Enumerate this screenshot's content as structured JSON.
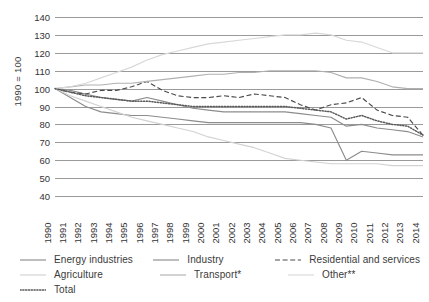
{
  "axis": {
    "y_title": "1990 = 100",
    "y_ticks": [
      "140",
      "130",
      "120",
      "110",
      "100",
      "90",
      "80",
      "70",
      "60",
      "50",
      "40"
    ],
    "x_ticks": [
      "1990",
      "1991",
      "1992",
      "1993",
      "1994",
      "1995",
      "1996",
      "1997",
      "1998",
      "1999",
      "2000",
      "2001",
      "2002",
      "2003",
      "2004",
      "2005",
      "2006",
      "2007",
      "2008",
      "2009",
      "2010",
      "2011",
      "2012",
      "2013",
      "2014"
    ]
  },
  "legend": {
    "rows": [
      [
        {
          "label": "Energy industries",
          "style": "solid",
          "color": "#8c8c8c"
        },
        {
          "label": "Industry",
          "style": "solid",
          "color": "#8c8c8c"
        },
        {
          "label": "Residential and services",
          "style": "dashed",
          "color": "#4a4a4a"
        }
      ],
      [
        {
          "label": "Agriculture",
          "style": "solid",
          "color": "#d2d2d2"
        },
        {
          "label": "Transport*",
          "style": "solid",
          "color": "#b0b0b0"
        },
        {
          "label": "Other**",
          "style": "solid",
          "color": "#d8d8d8"
        }
      ],
      [
        {
          "label": "Total",
          "style": "dotted",
          "color": "#5a5a5a"
        }
      ]
    ]
  },
  "chart_data": {
    "type": "line",
    "title": "",
    "xlabel": "",
    "ylabel": "1990 = 100",
    "ylim": [
      40,
      140
    ],
    "ytick_step": 10,
    "grid": true,
    "legend_position": "bottom",
    "x": [
      1990,
      1991,
      1992,
      1993,
      1994,
      1995,
      1996,
      1997,
      1998,
      1999,
      2000,
      2001,
      2002,
      2003,
      2004,
      2005,
      2006,
      2007,
      2008,
      2009,
      2010,
      2011,
      2012,
      2013,
      2014
    ],
    "series": [
      {
        "name": "Energy industries",
        "style": "solid",
        "color": "#8c8c8c",
        "values": [
          100,
          99,
          97,
          95,
          94,
          93,
          95,
          93,
          91,
          89,
          88,
          87,
          87,
          87,
          87,
          87,
          86,
          85,
          84,
          79,
          80,
          78,
          77,
          76,
          73
        ]
      },
      {
        "name": "Industry",
        "style": "solid",
        "color": "#8c8c8c",
        "values": [
          100,
          95,
          90,
          87,
          86,
          85,
          85,
          84,
          83,
          82,
          81,
          81,
          81,
          81,
          81,
          81,
          81,
          80,
          78,
          60,
          65,
          64,
          63,
          63,
          63
        ]
      },
      {
        "name": "Residential and services",
        "style": "dashed",
        "color": "#4a4a4a",
        "values": [
          100,
          98,
          97,
          99,
          99,
          101,
          104,
          99,
          96,
          95,
          95,
          96,
          95,
          97,
          96,
          95,
          91,
          88,
          91,
          92,
          95,
          88,
          85,
          84,
          74
        ]
      },
      {
        "name": "Agriculture",
        "style": "solid",
        "color": "#d2d2d2",
        "values": [
          100,
          96,
          93,
          90,
          87,
          84,
          82,
          80,
          78,
          76,
          73,
          71,
          69,
          67,
          64,
          61,
          60,
          59,
          58,
          58,
          58,
          58,
          57,
          57,
          57
        ]
      },
      {
        "name": "Transport*",
        "style": "solid",
        "color": "#b0b0b0",
        "values": [
          100,
          101,
          102,
          102,
          103,
          103,
          104,
          105,
          106,
          107,
          108,
          108,
          109,
          109,
          110,
          110,
          110,
          110,
          109,
          106,
          106,
          104,
          101,
          100,
          100
        ]
      },
      {
        "name": "Other**",
        "style": "solid",
        "color": "#d8d8d8",
        "values": [
          100,
          101,
          103,
          106,
          109,
          112,
          116,
          119,
          121,
          123,
          125,
          126,
          127,
          128,
          129,
          130,
          130,
          131,
          130,
          127,
          126,
          123,
          120,
          120,
          120
        ]
      },
      {
        "name": "Total",
        "style": "dotted",
        "color": "#5a5a5a",
        "values": [
          100,
          98,
          96,
          95,
          94,
          93,
          93,
          92,
          91,
          90,
          90,
          90,
          90,
          90,
          90,
          90,
          89,
          88,
          87,
          83,
          85,
          82,
          80,
          79,
          74
        ]
      }
    ]
  }
}
